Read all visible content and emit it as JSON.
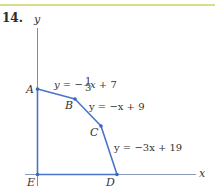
{
  "problem": {
    "number": "14."
  },
  "axes": {
    "x_label": "x",
    "y_label": "y"
  },
  "points": [
    {
      "name": "A",
      "px": [
        37,
        89
      ]
    },
    {
      "name": "B",
      "px": [
        75,
        99
      ]
    },
    {
      "name": "C",
      "px": [
        101,
        126
      ]
    },
    {
      "name": "D",
      "px": [
        117,
        174
      ]
    },
    {
      "name": "E",
      "px": [
        38,
        174
      ]
    }
  ],
  "equations": [
    {
      "id": "AB",
      "lhs": "y",
      "text": "y = −⅓x + 7",
      "slope_num": "1",
      "slope_den": "3",
      "rest": "x + 7"
    },
    {
      "id": "BC",
      "text": "y = −x + 9"
    },
    {
      "id": "CD",
      "text": "y = −3x + 19"
    }
  ],
  "colors": {
    "polygon": "#4a74c9",
    "axis": "#888888",
    "rule": "#d9dc8a"
  }
}
